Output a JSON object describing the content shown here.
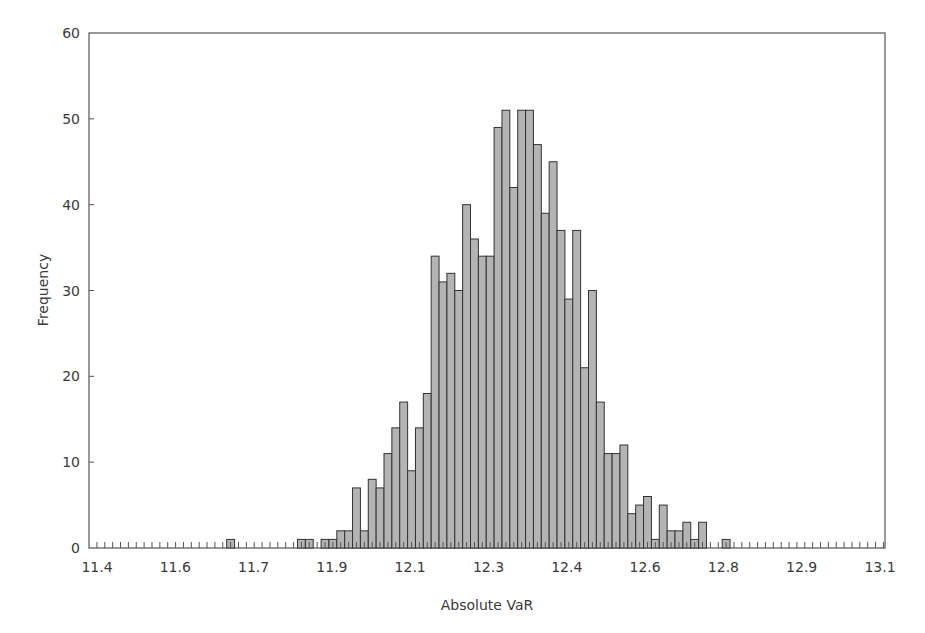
{
  "chart_data": {
    "type": "bar",
    "title": "",
    "xlabel": "Absolute VaR",
    "ylabel": "Frequency",
    "ylim": [
      0,
      60
    ],
    "yticks": [
      0,
      10,
      20,
      30,
      40,
      50,
      60
    ],
    "xtick_labels": [
      "11.4",
      "11.6",
      "11.7",
      "11.9",
      "12.1",
      "12.3",
      "12.4",
      "12.6",
      "12.8",
      "12.9",
      "13.1"
    ],
    "xlim": [
      11.4,
      13.1
    ],
    "grid": false,
    "legend": null,
    "bin_count": 101,
    "bars": [
      {
        "bin": 17,
        "value": 1
      },
      {
        "bin": 26,
        "value": 1
      },
      {
        "bin": 27,
        "value": 1
      },
      {
        "bin": 29,
        "value": 1
      },
      {
        "bin": 30,
        "value": 1
      },
      {
        "bin": 31,
        "value": 2
      },
      {
        "bin": 32,
        "value": 2
      },
      {
        "bin": 33,
        "value": 7
      },
      {
        "bin": 34,
        "value": 2
      },
      {
        "bin": 35,
        "value": 8
      },
      {
        "bin": 36,
        "value": 7
      },
      {
        "bin": 37,
        "value": 11
      },
      {
        "bin": 38,
        "value": 14
      },
      {
        "bin": 39,
        "value": 17
      },
      {
        "bin": 40,
        "value": 9
      },
      {
        "bin": 41,
        "value": 14
      },
      {
        "bin": 42,
        "value": 18
      },
      {
        "bin": 43,
        "value": 34
      },
      {
        "bin": 44,
        "value": 31
      },
      {
        "bin": 45,
        "value": 32
      },
      {
        "bin": 46,
        "value": 30
      },
      {
        "bin": 47,
        "value": 40
      },
      {
        "bin": 48,
        "value": 36
      },
      {
        "bin": 49,
        "value": 34
      },
      {
        "bin": 50,
        "value": 34
      },
      {
        "bin": 51,
        "value": 49
      },
      {
        "bin": 52,
        "value": 51
      },
      {
        "bin": 53,
        "value": 42
      },
      {
        "bin": 54,
        "value": 51
      },
      {
        "bin": 55,
        "value": 51
      },
      {
        "bin": 56,
        "value": 47
      },
      {
        "bin": 57,
        "value": 39
      },
      {
        "bin": 58,
        "value": 45
      },
      {
        "bin": 59,
        "value": 37
      },
      {
        "bin": 60,
        "value": 29
      },
      {
        "bin": 61,
        "value": 37
      },
      {
        "bin": 62,
        "value": 21
      },
      {
        "bin": 63,
        "value": 30
      },
      {
        "bin": 64,
        "value": 17
      },
      {
        "bin": 65,
        "value": 11
      },
      {
        "bin": 66,
        "value": 11
      },
      {
        "bin": 67,
        "value": 12
      },
      {
        "bin": 68,
        "value": 4
      },
      {
        "bin": 69,
        "value": 5
      },
      {
        "bin": 70,
        "value": 6
      },
      {
        "bin": 71,
        "value": 1
      },
      {
        "bin": 72,
        "value": 5
      },
      {
        "bin": 73,
        "value": 2
      },
      {
        "bin": 74,
        "value": 2
      },
      {
        "bin": 75,
        "value": 3
      },
      {
        "bin": 76,
        "value": 1
      },
      {
        "bin": 77,
        "value": 3
      },
      {
        "bin": 80,
        "value": 1
      }
    ],
    "colors": {
      "bar_fill": "#b4b4b4",
      "bar_stroke": "#333333",
      "axis": "#555555"
    }
  }
}
